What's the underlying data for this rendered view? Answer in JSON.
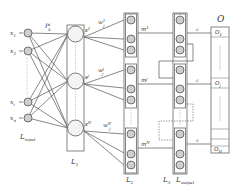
{
  "diagram": {
    "input_layer": {
      "label": "L",
      "label_sub": "input",
      "nodes": [
        {
          "label": "x",
          "sub": "1"
        },
        {
          "label": "x",
          "sub": "2"
        },
        {
          "label": "x",
          "sub": "i"
        },
        {
          "label": "x",
          "sub": "n"
        }
      ]
    },
    "weight_label": {
      "label": "P",
      "sub": "k",
      "sup": "i"
    },
    "layer1": {
      "label": "L",
      "label_sub": "1",
      "nodes": [
        {
          "label": "s",
          "sup": "1"
        },
        {
          "label": "s",
          "sup": "j"
        },
        {
          "label": "s",
          "sup": "N"
        }
      ],
      "weights": [
        {
          "label": "w",
          "sup": "1",
          "sub": "j"
        },
        {
          "label": "w",
          "sup": "j",
          "sub": "j"
        },
        {
          "label": "w",
          "sup": "N",
          "sub": "j"
        }
      ]
    },
    "layer2": {
      "label": "L",
      "label_sub": "2",
      "groups": [
        {
          "label": "m",
          "sup": "1"
        },
        {
          "label": "m",
          "sup": "j"
        },
        {
          "label": "m",
          "sup": "N"
        }
      ]
    },
    "layer3": {
      "label": "L",
      "label_sub": "3",
      "connections": [
        {
          "label": "c"
        },
        {
          "label": "c"
        },
        {
          "label": "v"
        }
      ]
    },
    "output_layer": {
      "label": "L",
      "label_sub": "output",
      "title": "O",
      "nodes": [
        {
          "label": "O",
          "sub": "1"
        },
        {
          "label": "O",
          "sub": "j"
        },
        {
          "label": "O",
          "sub": "N"
        }
      ]
    }
  }
}
